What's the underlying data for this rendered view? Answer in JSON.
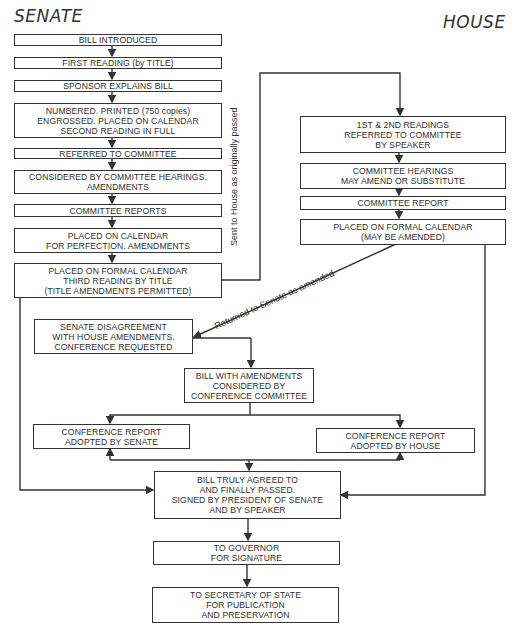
{
  "headers": {
    "senate": "SENATE",
    "house": "HOUSE"
  },
  "senate_steps": [
    {
      "lines": [
        "BILL INTRODUCED"
      ]
    },
    {
      "lines": [
        "FIRST READING (by TITLE)"
      ]
    },
    {
      "lines": [
        "SPONSOR EXPLAINS BILL"
      ]
    },
    {
      "lines": [
        "NUMBERED. PRINTED (750 copies)",
        "ENGROSSED. PLACED ON CALENDAR",
        "SECOND READING IN FULL"
      ]
    },
    {
      "lines": [
        "REFERRED TO COMMITTEE"
      ]
    },
    {
      "lines": [
        "CONSIDERED BY COMMITTEE HEARINGS.",
        "AMENDMENTS"
      ]
    },
    {
      "lines": [
        "COMMITTEE REPORTS"
      ]
    },
    {
      "lines": [
        "PLACED ON CALENDAR",
        "FOR PERFECTION. AMENDMENTS"
      ]
    },
    {
      "lines": [
        "PLACED ON FORMAL CALENDAR",
        "THIRD READING BY TITLE",
        "(TITLE AMENDMENTS PERMITTED)"
      ]
    }
  ],
  "house_steps": [
    {
      "lines": [
        "1ST & 2ND READINGS",
        "REFERRED TO COMMITTEE",
        "BY SPEAKER"
      ]
    },
    {
      "lines": [
        "COMMITTEE HEARINGS",
        "MAY AMEND OR SUBSTITUTE"
      ]
    },
    {
      "lines": [
        "COMMITTEE REPORT"
      ]
    },
    {
      "lines": [
        "PLACED ON FORMAL CALENDAR",
        "(MAY BE AMENDED)"
      ]
    }
  ],
  "conference": {
    "disagreement": {
      "lines": [
        "SENATE DISAGREEMENT",
        "WITH HOUSE AMENDMENTS.",
        "CONFERENCE REQUESTED"
      ]
    },
    "committee": {
      "lines": [
        "BILL WITH AMENDMENTS",
        "CONSIDERED BY",
        "CONFERENCE COMMITTEE"
      ]
    },
    "senate_report": {
      "lines": [
        "CONFERENCE REPORT",
        "ADOPTED BY SENATE"
      ]
    },
    "house_report": {
      "lines": [
        "CONFERENCE REPORT",
        "ADOPTED BY HOUSE"
      ]
    }
  },
  "final_steps": [
    {
      "lines": [
        "BILL TRULY AGREED TO",
        "AND FINALLY PASSED.",
        "SIGNED BY PRESIDENT OF SENATE",
        "AND BY SPEAKER"
      ]
    },
    {
      "lines": [
        "TO GOVERNOR",
        "FOR SIGNATURE"
      ]
    },
    {
      "lines": [
        "TO SECRETARY OF STATE",
        "FOR PUBLICATION",
        "AND PRESERVATION"
      ]
    }
  ],
  "edge_labels": {
    "sent_to_house": "Sent to House as originally passed",
    "returned_to_senate": "Returned to Senate as amended"
  },
  "colors": {
    "line": "#333333",
    "background": "#ffffff"
  }
}
